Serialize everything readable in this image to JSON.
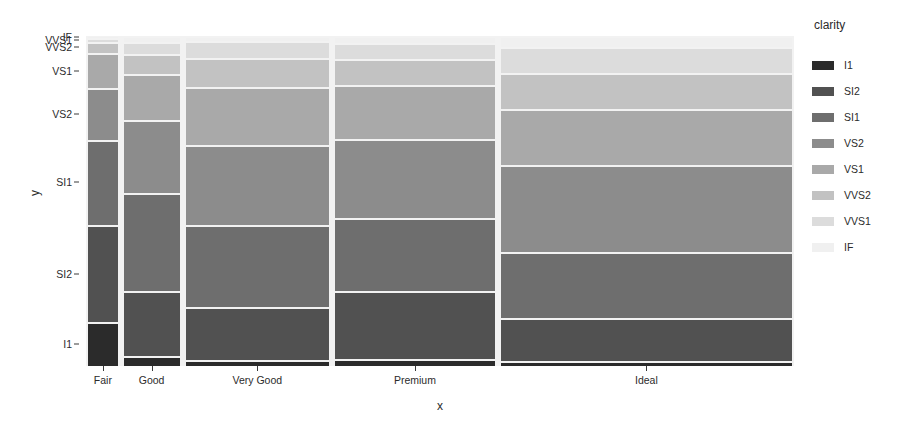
{
  "legend": {
    "title": "clarity",
    "items": [
      {
        "label": "I1",
        "color": "#2b2b2b"
      },
      {
        "label": "SI2",
        "color": "#515151"
      },
      {
        "label": "SI1",
        "color": "#6e6e6e"
      },
      {
        "label": "VS2",
        "color": "#8c8c8c"
      },
      {
        "label": "VS1",
        "color": "#a9a9a9"
      },
      {
        "label": "VVS2",
        "color": "#c2c2c2"
      },
      {
        "label": "VVS1",
        "color": "#dcdcdc"
      },
      {
        "label": "IF",
        "color": "#f0f0f0"
      }
    ]
  },
  "axes": {
    "x_title": "x",
    "y_title": "y",
    "x_categories": [
      "Fair",
      "Good",
      "Very Good",
      "Premium",
      "Ideal"
    ],
    "y_categories": [
      "I1",
      "SI2",
      "SI1",
      "VS2",
      "VS1",
      "VVS2",
      "VVS1",
      "IF"
    ]
  },
  "chart_data": {
    "type": "bar",
    "subtype": "mosaic-spineplot",
    "title": "",
    "xlabel": "x",
    "ylabel": "y",
    "grid": false,
    "legend_position": "right",
    "legend_title": "clarity",
    "categories": [
      "Fair",
      "Good",
      "Very Good",
      "Premium",
      "Ideal"
    ],
    "stack_levels": [
      "I1",
      "SI2",
      "SI1",
      "VS2",
      "VS1",
      "VVS2",
      "VVS1",
      "IF"
    ],
    "panel_background": "#f2f2f2",
    "column_widths_fraction": [
      0.042,
      0.079,
      0.203,
      0.226,
      0.412
    ],
    "series": [
      {
        "name": "I1",
        "color": "#2b2b2b",
        "values": [
          0.132,
          0.03,
          0.017,
          0.021,
          0.014
        ]
      },
      {
        "name": "SI2",
        "color": "#515151",
        "values": [
          0.293,
          0.197,
          0.161,
          0.207,
          0.131
        ]
      },
      {
        "name": "SI1",
        "color": "#6e6e6e",
        "values": [
          0.256,
          0.298,
          0.249,
          0.221,
          0.201
        ]
      },
      {
        "name": "VS2",
        "color": "#8c8c8c",
        "values": [
          0.157,
          0.22,
          0.244,
          0.239,
          0.262
        ]
      },
      {
        "name": "VS1",
        "color": "#a9a9a9",
        "values": [
          0.104,
          0.139,
          0.175,
          0.164,
          0.17
        ]
      },
      {
        "name": "VVS2",
        "color": "#c2c2c2",
        "values": [
          0.035,
          0.063,
          0.086,
          0.077,
          0.111
        ]
      },
      {
        "name": "VVS1",
        "color": "#dcdcdc",
        "values": [
          0.011,
          0.036,
          0.053,
          0.049,
          0.079
        ]
      },
      {
        "name": "IF",
        "color": "#f0f0f0",
        "values": [
          0.006,
          0.017,
          0.015,
          0.022,
          0.032
        ]
      }
    ],
    "y_tick_labels": [
      "I1",
      "SI2",
      "SI1",
      "VS2",
      "VS1",
      "VVS2",
      "VVS1",
      "IF"
    ],
    "x_tick_labels": [
      "Fair",
      "Good",
      "Very Good",
      "Premium",
      "Ideal"
    ]
  }
}
